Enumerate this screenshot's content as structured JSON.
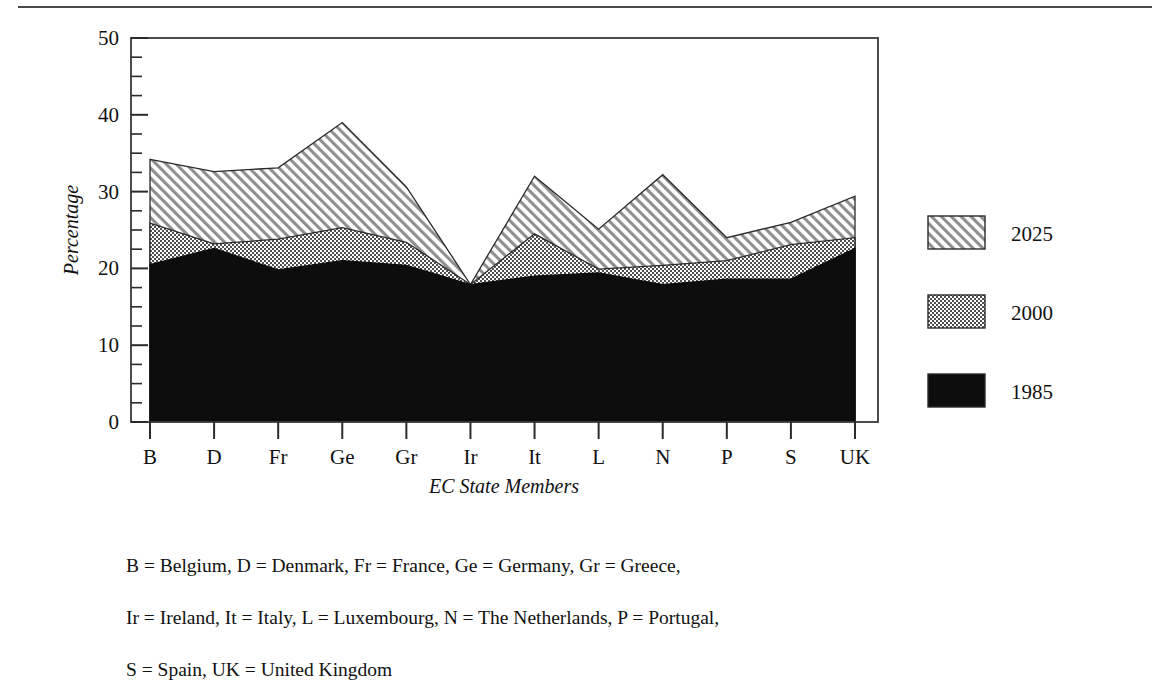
{
  "figure": {
    "has_top_rule": true,
    "background": "#ffffff",
    "ink": "#111111"
  },
  "caption": {
    "lines": [
      "B = Belgium, D = Denmark, Fr = France, Ge = Germany, Gr = Greece,",
      "Ir = Ireland, It = Italy, L = Luxembourg, N = The Netherlands, P = Portugal,",
      "S = Spain, UK = United Kingdom"
    ]
  },
  "legend": {
    "position": "right",
    "items": [
      {
        "label": "2025",
        "pattern": "diagonal-hatch",
        "color": "#8c8c8c"
      },
      {
        "label": "2000",
        "pattern": "crosshatch-dot",
        "color": "#6e6e6e"
      },
      {
        "label": "1985",
        "pattern": "solid",
        "color": "#0d0d0d"
      }
    ]
  },
  "chart_data": {
    "type": "area",
    "stacked": false,
    "title": "",
    "xlabel": "EC State Members",
    "ylabel": "Percentage",
    "ylim": [
      0,
      50
    ],
    "yticks": [
      0,
      10,
      20,
      30,
      40,
      50
    ],
    "yticklabels": [
      "0",
      "10",
      "20",
      "30",
      "40",
      "50"
    ],
    "minor_tick_step": 2.5,
    "grid": false,
    "categories": [
      "B",
      "D",
      "Fr",
      "Ge",
      "Gr",
      "Ir",
      "It",
      "L",
      "N",
      "P",
      "S",
      "UK"
    ],
    "series": [
      {
        "name": "2025",
        "values": [
          34.2,
          32.6,
          33.1,
          39.0,
          30.6,
          17.9,
          32.0,
          25.1,
          32.2,
          24.0,
          26.0,
          29.4
        ]
      },
      {
        "name": "2000",
        "values": [
          25.9,
          23.2,
          23.8,
          25.3,
          23.4,
          17.9,
          24.5,
          19.9,
          20.4,
          21.0,
          23.1,
          24.0
        ]
      },
      {
        "name": "1985",
        "values": [
          20.5,
          22.6,
          19.8,
          21.0,
          20.4,
          17.9,
          19.0,
          19.4,
          17.9,
          18.6,
          18.6,
          22.6
        ]
      }
    ]
  }
}
